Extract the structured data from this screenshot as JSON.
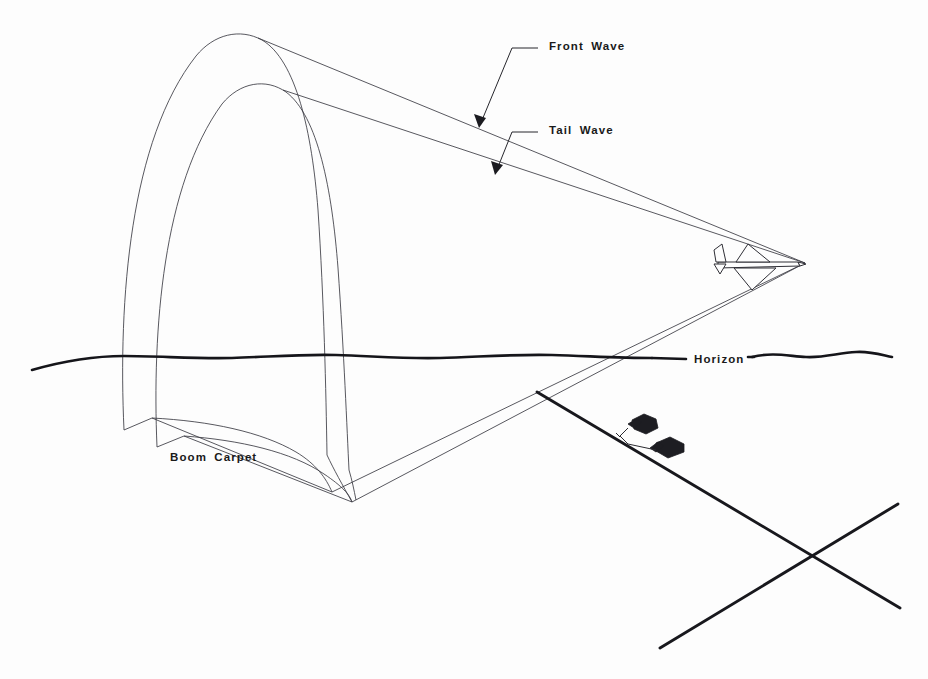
{
  "figure": {
    "kind": "technical-line-diagram",
    "background_color": "#fdfdfd",
    "line_color": "#2e2e35",
    "heavy_line_color": "#18181d",
    "text_color": "#1a1a1a"
  },
  "labels": {
    "front_wave": "Front  Wave",
    "tail_wave": "Tail  Wave",
    "horizon": "Horizon",
    "boom_carpet": "Boom  Carpet"
  },
  "icons": {
    "aircraft": "supersonic-aircraft-icon",
    "building_one": "airfield-building-icon",
    "building_two": "airfield-building-icon",
    "front_wave_arrow": "leader-arrow-icon",
    "tail_wave_arrow": "leader-arrow-icon"
  },
  "geometry": {
    "cone_apex": {
      "x": 805,
      "y": 263
    },
    "cone_lower_vertex": {
      "x": 332,
      "y": 492
    },
    "horizon_y": 357,
    "horizon_x_start": 32,
    "horizon_x_end": 892,
    "runway_cross": {
      "x": 805,
      "y": 558
    }
  },
  "label_positions": {
    "front_wave": {
      "x": 549,
      "y": 46
    },
    "tail_wave": {
      "x": 549,
      "y": 130
    },
    "horizon": {
      "x": 700,
      "y": 362
    },
    "boom_carpet": {
      "x": 170,
      "y": 457
    }
  }
}
